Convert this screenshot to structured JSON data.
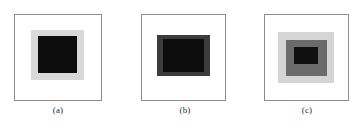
{
  "figure": {
    "width": 360,
    "height": 131,
    "background": "#ffffff",
    "panel_border_color": "#8d8d8d",
    "panel_fill": "#ffffff"
  },
  "chart_data": {
    "type": "diagram",
    "title": "",
    "panels": [
      {
        "id": "a",
        "caption": "(a)",
        "frame": {
          "x": 14,
          "y": 14,
          "w": 88,
          "h": 87
        },
        "layers": [
          {
            "name": "outer-surround",
            "color": "#d9d9d9",
            "x": 31,
            "y": 30,
            "w": 53,
            "h": 50
          },
          {
            "name": "inner-target",
            "color": "#0d0d0d",
            "x": 38,
            "y": 36,
            "w": 39,
            "h": 37
          }
        ]
      },
      {
        "id": "b",
        "caption": "(b)",
        "frame": {
          "x": 141,
          "y": 14,
          "w": 85,
          "h": 87
        },
        "layers": [
          {
            "name": "outer-surround",
            "color": "#3c3c3c",
            "x": 157,
            "y": 35,
            "w": 53,
            "h": 41
          },
          {
            "name": "inner-target",
            "color": "#0d0d0d",
            "x": 163,
            "y": 39,
            "w": 41,
            "h": 33
          }
        ]
      },
      {
        "id": "c",
        "caption": "(c)",
        "frame": {
          "x": 264,
          "y": 14,
          "w": 85,
          "h": 87
        },
        "layers": [
          {
            "name": "outer-surround",
            "color": "#d5d5d5",
            "x": 278,
            "y": 32,
            "w": 56,
            "h": 51
          },
          {
            "name": "middle-surround",
            "color": "#6b6b6b",
            "x": 286,
            "y": 40,
            "w": 41,
            "h": 36
          },
          {
            "name": "inner-target",
            "color": "#101010",
            "x": 294,
            "y": 47,
            "w": 24,
            "h": 17
          }
        ]
      }
    ],
    "captions": [
      {
        "label": "(a)",
        "x": 33,
        "y": 105,
        "w": 50
      },
      {
        "label": "(b)",
        "x": 160,
        "y": 105,
        "w": 50
      },
      {
        "label": "(c)",
        "x": 282,
        "y": 105,
        "w": 50
      }
    ]
  }
}
